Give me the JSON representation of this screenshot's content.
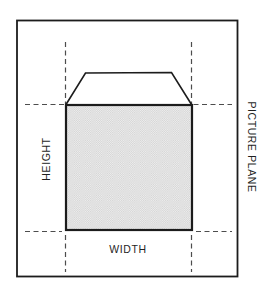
{
  "diagram": {
    "labels": {
      "height": "HEIGHT",
      "width": "WIDTH",
      "picture_plane": "PICTURE PLANE"
    }
  },
  "colors": {
    "background": "#ffffff",
    "line": "#1c1c1c",
    "dashed": "#4d4d4d",
    "text": "#1f1f1f",
    "fill_bg": "#f0f0f0",
    "fill_dot": "#d2d2d2"
  }
}
